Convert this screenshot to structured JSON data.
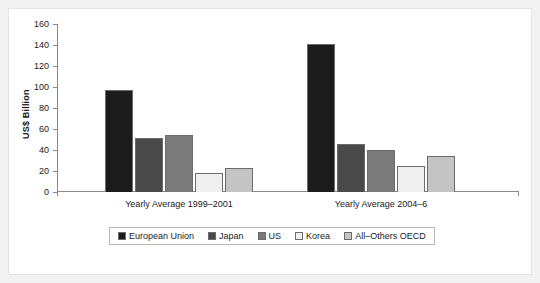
{
  "chart_data": {
    "type": "bar",
    "title": "",
    "xlabel": "",
    "ylabel": "US$ Billion",
    "ylim": [
      0,
      160
    ],
    "ytick_step": 20,
    "yticks": [
      160,
      140,
      120,
      100,
      80,
      60,
      40,
      20,
      0
    ],
    "grid": false,
    "legend_position": "bottom",
    "categories": [
      "Yearly Average 1999–2001",
      "Yearly Average 2004–6"
    ],
    "series": [
      {
        "name": "European Union",
        "color": "#1c1c1c",
        "values": [
          97,
          141
        ]
      },
      {
        "name": "Japan",
        "color": "#4a4a4a",
        "values": [
          51,
          46
        ]
      },
      {
        "name": "US",
        "color": "#7a7a7a",
        "values": [
          54,
          40
        ]
      },
      {
        "name": "Korea",
        "color": "#efefef",
        "values": [
          18,
          25
        ]
      },
      {
        "name": "All–Others OECD",
        "color": "#c4c4c4",
        "values": [
          23,
          34
        ]
      }
    ]
  },
  "colors": {
    "frame": "#f2f2f2",
    "plot_background": "#ffffff",
    "axis": "#8a8a8a",
    "bar_outline": "#6b6b6b",
    "legend_border": "#b8b8b8",
    "text": "#1a1a1a"
  }
}
